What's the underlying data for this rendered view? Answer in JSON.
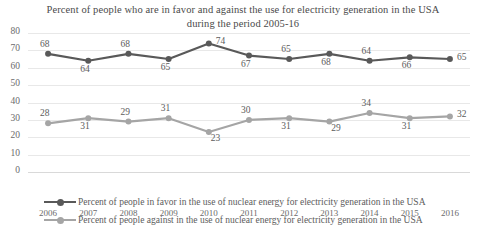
{
  "chart_data": {
    "type": "line",
    "title": "Percent of people who are in favor and against the use for electricity generation in the USA during the period 2005-16",
    "title_line1": "Percent of people who are in favor and against the use for electricity",
    "title_line2": "generation in the USA during the period 2005-16",
    "xlabel": "",
    "ylabel": "",
    "ylim": [
      0,
      80
    ],
    "yticks": [
      0,
      10,
      20,
      30,
      40,
      50,
      60,
      70,
      80
    ],
    "grid": true,
    "legend_position": "bottom-left",
    "categories": [
      "2006",
      "2007",
      "2008",
      "2009",
      "2010",
      "2011",
      "2012",
      "2013",
      "2014",
      "2015",
      "2016"
    ],
    "series": [
      {
        "name": "Percent of people in favor in the use of nuclear energy for electricity generation in the USA",
        "color": "#595959",
        "values": [
          68,
          64,
          68,
          65,
          74,
          67,
          65,
          68,
          64,
          66,
          65
        ]
      },
      {
        "name": "Percent of people against in the use of nuclear energy for electricity generation in the USA",
        "color": "#a5a5a5",
        "values": [
          28,
          31,
          29,
          31,
          23,
          30,
          31,
          29,
          34,
          31,
          32
        ]
      }
    ]
  },
  "colors": {
    "favor": "#595959",
    "against": "#a5a5a5",
    "grid": "#e8e8e8",
    "text": "#5c5c5c",
    "background": "#ffffff"
  }
}
